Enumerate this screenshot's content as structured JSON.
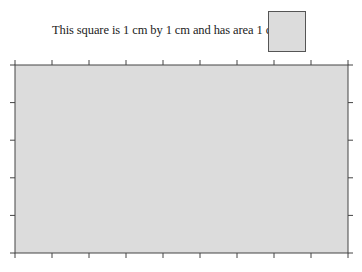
{
  "caption": {
    "prefix": "This square is 1 cm by 1 cm and has area 1 cm",
    "superscript": "2",
    "suffix": " :"
  },
  "unit_square": {
    "side_cm": 1,
    "fill": "#dcdcdc",
    "stroke": "#555555"
  },
  "grid": {
    "width_cm": 9,
    "height_cm": 5,
    "fill": "#dcdcdc",
    "stroke": "#444444",
    "ticks_x": 10,
    "ticks_y": 6,
    "tick_direction": "outward"
  }
}
